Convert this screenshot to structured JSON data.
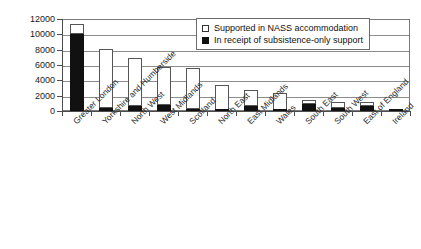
{
  "chart_data": {
    "type": "bar",
    "title": "",
    "subtitle": "",
    "xlabel": "",
    "ylabel": "",
    "ylim": [
      0,
      12000
    ],
    "ytick_step": 2000,
    "yticks": [
      "0",
      "2000",
      "4000",
      "6000",
      "8000",
      "10000",
      "12000"
    ],
    "grid": true,
    "stacked": true,
    "legend_position": "top-right",
    "categories": [
      "Greater London",
      "Yorkshire and Humberside",
      "North West",
      "West Midlands",
      "Scotland",
      "North East",
      "East Midlands",
      "Wales",
      "South East",
      "South West",
      "East of England",
      "Ireland"
    ],
    "series": [
      {
        "name": "In receipt of subsistence-only support",
        "style": "solid-black",
        "color": "#111111",
        "values": [
          10000,
          400,
          700,
          800,
          250,
          50,
          600,
          30,
          900,
          350,
          600,
          20
        ]
      },
      {
        "name": "Supported in NASS accommodation",
        "style": "open-white",
        "color": "#ffffff",
        "values": [
          1300,
          7650,
          6200,
          5000,
          5300,
          3400,
          2100,
          2370,
          550,
          800,
          550,
          60
        ]
      }
    ],
    "totals": [
      11300,
      8050,
      6900,
      5800,
      5550,
      3450,
      2700,
      2400,
      1450,
      1150,
      1150,
      80
    ]
  },
  "legend": {
    "items": [
      {
        "label": "Supported in NASS accommodation",
        "swatch": "open"
      },
      {
        "label": "In receipt of subsistence-only support",
        "swatch": "solid"
      }
    ]
  },
  "axes": {
    "y": {
      "ticks": [
        "12000",
        "10000",
        "8000",
        "6000",
        "4000",
        "2000",
        "0"
      ]
    }
  },
  "colors": {
    "solid_series": "#111111",
    "open_series": "#ffffff",
    "frame": "#7a7a7a",
    "gridline": "#8c8c8c",
    "axis": "#4d4d4d",
    "text": "#1a1a1a",
    "background": "#ffffff"
  }
}
